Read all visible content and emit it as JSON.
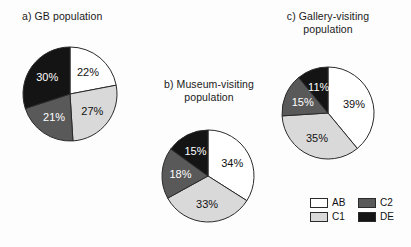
{
  "figure": {
    "background_color": "#fdfdfd",
    "width": 411,
    "height": 247
  },
  "palette": {
    "AB": "#ffffff",
    "C1": "#d9d9d9",
    "C2": "#595959",
    "DE": "#141414",
    "outline": "#2a2a2a",
    "label_dark": "#111111",
    "label_light": "#ffffff"
  },
  "legend": {
    "position": "bottom-right",
    "entries": [
      {
        "label": "AB",
        "color": "#ffffff"
      },
      {
        "label": "C1",
        "color": "#d9d9d9"
      },
      {
        "label": "C2",
        "color": "#595959"
      },
      {
        "label": "DE",
        "color": "#141414"
      }
    ]
  },
  "chart_data": [
    {
      "type": "pie",
      "id": "a",
      "title": "a) GB population",
      "categories": [
        "AB",
        "C1",
        "C2",
        "DE"
      ],
      "values": [
        22,
        27,
        21,
        30
      ],
      "labels": [
        "22%",
        "27%",
        "21%",
        "30%"
      ],
      "colors": [
        "#ffffff",
        "#d9d9d9",
        "#595959",
        "#141414"
      ],
      "start_angle": 0,
      "direction": "clockwise",
      "center": [
        70,
        94
      ],
      "radius": 47
    },
    {
      "type": "pie",
      "id": "b",
      "title": "b) Museum-visiting population",
      "title_lines": [
        "b) Museum-visiting",
        "population"
      ],
      "categories": [
        "AB",
        "C1",
        "C2",
        "DE"
      ],
      "values": [
        34,
        33,
        18,
        15
      ],
      "labels": [
        "34%",
        "33%",
        "18%",
        "15%"
      ],
      "colors": [
        "#ffffff",
        "#d9d9d9",
        "#595959",
        "#141414"
      ],
      "start_angle": 0,
      "direction": "clockwise",
      "center": [
        208,
        176
      ],
      "radius": 46
    },
    {
      "type": "pie",
      "id": "c",
      "title": "c) Gallery-visiting population",
      "title_lines": [
        "c) Gallery-visiting",
        "population"
      ],
      "categories": [
        "AB",
        "C1",
        "C2",
        "DE"
      ],
      "values": [
        39,
        35,
        15,
        11
      ],
      "labels": [
        "39%",
        "35%",
        "15%",
        "11%"
      ],
      "colors": [
        "#ffffff",
        "#d9d9d9",
        "#595959",
        "#141414"
      ],
      "start_angle": 0,
      "direction": "clockwise",
      "center": [
        328,
        113
      ],
      "radius": 46
    }
  ],
  "titles": {
    "a": "a) GB population",
    "b": "b) Museum-visiting\npopulation",
    "c": "c) Gallery-visiting\npopulation"
  }
}
